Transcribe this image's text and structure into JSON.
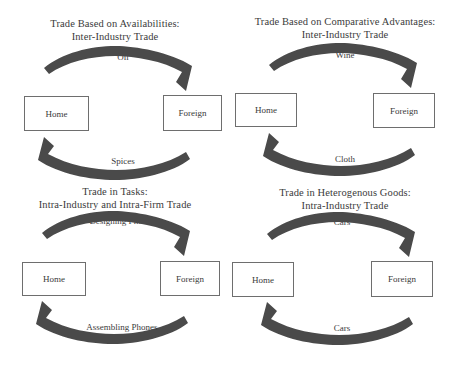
{
  "figure": {
    "background_color": "#ffffff",
    "arrow_color": "#4a4a4a",
    "box_border_color": "#6e6e6e",
    "text_color": "#3b3b3b"
  },
  "panels": [
    {
      "id": "availabilities",
      "title_line1": "Trade Based on  Availabilities:",
      "title_line2": "Inter-Industry Trade",
      "home_label": "Home",
      "foreign_label": "Foreign",
      "top_flow_label": "Oil",
      "bottom_flow_label": "Spices"
    },
    {
      "id": "comparative-advantages",
      "title_line1": "Trade Based on Comparative Advantages:",
      "title_line2": "Inter-Industry Trade",
      "home_label": "Home",
      "foreign_label": "Foreign",
      "top_flow_label": "Wine",
      "bottom_flow_label": "Cloth"
    },
    {
      "id": "tasks",
      "title_line1": "Trade in Tasks:",
      "title_line2": "Intra-Industry and Intra-Firm Trade",
      "home_label": "Home",
      "foreign_label": "Foreign",
      "top_flow_label": "Designing Phones",
      "bottom_flow_label": "Assembling Phones"
    },
    {
      "id": "heterogenous-goods",
      "title_line1": "Trade in Heterogenous Goods:",
      "title_line2": "Intra-Industry Trade",
      "home_label": "Home",
      "foreign_label": "Foreign",
      "top_flow_label": "Cars",
      "bottom_flow_label": "Cars"
    }
  ]
}
